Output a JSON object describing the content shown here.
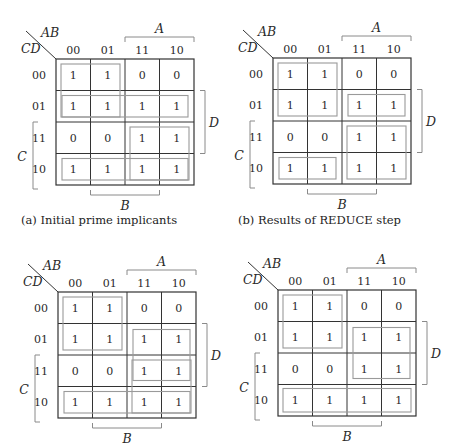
{
  "labels": {
    "row_var": "CD",
    "col_var": "AB",
    "col_headers": [
      "00",
      "01",
      "11",
      "10"
    ],
    "row_headers": [
      "00",
      "01",
      "11",
      "10"
    ],
    "A": "A",
    "B": "B",
    "C": "C",
    "D": "D"
  },
  "cells": [
    [
      "1",
      "1",
      "0",
      "0"
    ],
    [
      "1",
      "1",
      "1",
      "1"
    ],
    [
      "0",
      "0",
      "1",
      "1"
    ],
    [
      "1",
      "1",
      "1",
      "1"
    ]
  ],
  "colors": {
    "grid": "#333333",
    "group": "#9a9a9a",
    "bracket": "#8a8a8a"
  },
  "maps": [
    {
      "id": "a",
      "origin": [
        56,
        59
      ],
      "caption": "(a) Initial prime implicants",
      "caption_pos": [
        21,
        213
      ],
      "groups": [
        {
          "r": 0,
          "c": 0,
          "h": 2,
          "w": 2
        },
        {
          "r": 1,
          "c": 0,
          "h": 1,
          "w": 4
        },
        {
          "r": 2,
          "c": 2,
          "h": 2,
          "w": 2
        },
        {
          "r": 3,
          "c": 0,
          "h": 1,
          "w": 4
        }
      ]
    },
    {
      "id": "b",
      "origin": [
        273,
        58
      ],
      "caption": "(b) Results of REDUCE step",
      "caption_pos": [
        238,
        213
      ],
      "groups": [
        {
          "r": 0,
          "c": 0,
          "h": 2,
          "w": 2
        },
        {
          "r": 1,
          "c": 2,
          "h": 1,
          "w": 2
        },
        {
          "r": 2,
          "c": 2,
          "h": 2,
          "w": 2
        },
        {
          "r": 3,
          "c": 0,
          "h": 1,
          "w": 2
        }
      ]
    },
    {
      "id": "c",
      "origin": [
        58,
        292
      ],
      "caption": "",
      "caption_pos": [
        21,
        440
      ],
      "groups": [
        {
          "r": 0,
          "c": 0,
          "h": 2,
          "w": 2
        },
        {
          "r": 1,
          "c": 2,
          "h": 2,
          "w": 2
        },
        {
          "r": 2,
          "c": 2,
          "h": 2,
          "w": 2
        },
        {
          "r": 3,
          "c": 0,
          "h": 1,
          "w": 4
        }
      ]
    },
    {
      "id": "d",
      "origin": [
        278,
        290
      ],
      "caption": "",
      "caption_pos": [
        238,
        440
      ],
      "groups": [
        {
          "r": 0,
          "c": 0,
          "h": 2,
          "w": 2
        },
        {
          "r": 1,
          "c": 2,
          "h": 2,
          "w": 2
        },
        {
          "r": 3,
          "c": 0,
          "h": 1,
          "w": 4
        }
      ]
    }
  ]
}
